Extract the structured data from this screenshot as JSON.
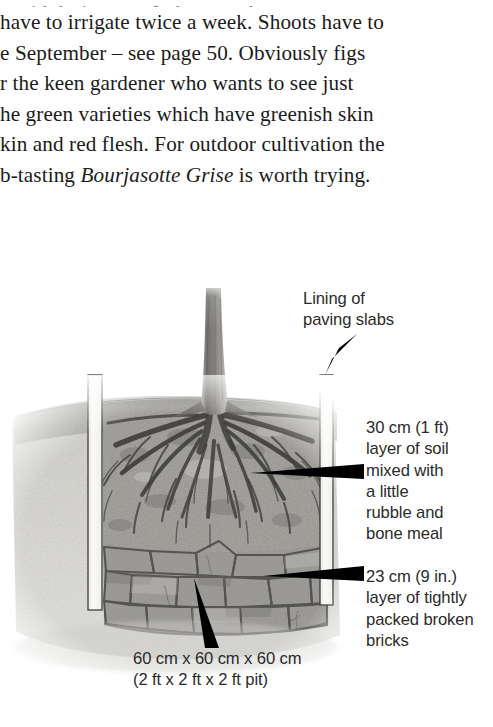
{
  "document": {
    "body_text": {
      "cut_line": "avoid drying out. In hot weather you may",
      "lines": [
        "have to irrigate twice a week. Shoots have to",
        "e September – see page 50. Obviously figs",
        "r the keen gardener who wants to see just",
        "he green varieties which have greenish skin",
        "kin and red flesh. For outdoor cultivation the",
        "b-tasting ",
        " is worth trying."
      ],
      "line6_prefix": "b-tasting ",
      "line6_italic": "Bourjasotte Grise",
      "line6_suffix": " is worth trying."
    }
  },
  "figure": {
    "callouts": {
      "lining": "Lining of\npaving slabs",
      "soil": "30 cm (1 ft)\nlayer of soil\nmixed with\na little\nrubble and\nbone meal",
      "bricks": "23 cm (9 in.)\nlayer of tightly\npacked broken\nbricks",
      "pit": "60 cm x 60 cm x 60 cm\n(2 ft x 2 ft x 2 ft pit)"
    },
    "parts": {
      "trunk": "fig-trunk",
      "roots": "fig-roots",
      "soil_layer": "soil-layer",
      "brick_layer": "broken-brick-layer",
      "slab_left": "paving-slab-left",
      "slab_right": "paving-slab-right",
      "ground_line": "ground-level-line"
    },
    "colors": {
      "page_background": "#ffffff",
      "ink": "#1b1b1b",
      "label_ink": "#2b2b2b",
      "arrow": "#000000",
      "soil_tone": "#a9a9a7",
      "subsoil_tone": "#c9c8c4",
      "brick_tone": "#9d9c98",
      "slab_tone": "#f4f3f0",
      "root_tone": "#4a4a49"
    }
  }
}
